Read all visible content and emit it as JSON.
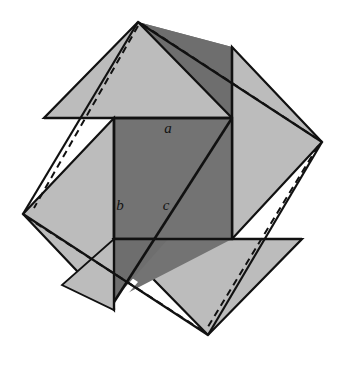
{
  "figure": {
    "kind": "geometric-diagram",
    "canvas": {
      "width": 346,
      "height": 369,
      "background": "#ffffff"
    },
    "colors": {
      "light_gray": "#b9b9b9",
      "mid_light_gray": "#c2c2c2",
      "dark_gray": "#707070",
      "shadow_gray": "#6a6a6a",
      "outline": "#111111",
      "white": "#ffffff"
    },
    "labels": [
      {
        "id": "a",
        "text": "a",
        "x": 168,
        "y": 133,
        "meaning": "short leg of right triangle"
      },
      {
        "id": "b",
        "text": "b",
        "x": 120,
        "y": 210,
        "meaning": "long leg of right triangle"
      },
      {
        "id": "c",
        "text": "c",
        "x": 166,
        "y": 210,
        "meaning": "hypotenuse of right triangle"
      }
    ],
    "squares": [
      {
        "name": "tilted-square-one",
        "style": "dashed-outline",
        "vertices": [
          [
            138,
            22
          ],
          [
            322,
            142
          ],
          [
            208,
            335
          ],
          [
            23,
            214
          ]
        ]
      },
      {
        "name": "tilted-square-two",
        "style": "dashed-outline",
        "vertices": [
          [
            138,
            22
          ],
          [
            322,
            142
          ],
          [
            208,
            335
          ],
          [
            23,
            214
          ]
        ]
      }
    ],
    "inner_square": {
      "name": "central-square",
      "vertices": [
        [
          114,
          118
        ],
        [
          232,
          118
        ],
        [
          232,
          239
        ],
        [
          114,
          239
        ]
      ],
      "fill": "#707070"
    },
    "hypotenuse_segment": {
      "from": [
        232,
        118
      ],
      "to": [
        114,
        300
      ]
    },
    "stroke_widths": {
      "outline": 2.2,
      "thin": 1.6,
      "dashed": 2.0
    }
  }
}
